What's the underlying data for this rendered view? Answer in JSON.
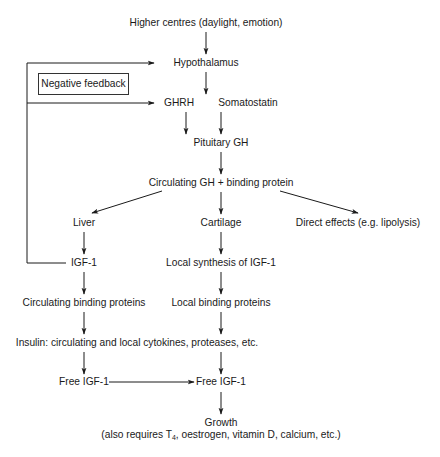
{
  "diagram": {
    "type": "flowchart",
    "topic": "Growth hormone / IGF-1 axis",
    "nodes": {
      "higher_centres": "Higher centres (daylight, emotion)",
      "hypothalamus": "Hypothalamus",
      "ghrh": "GHRH",
      "somatostatin": "Somatostatin",
      "pituitary_gh": "Pituitary GH",
      "circulating_gh": "Circulating GH + binding protein",
      "liver": "Liver",
      "cartilage": "Cartilage",
      "direct_effects": "Direct effects (e.g. lipolysis)",
      "igf1": "IGF-1",
      "local_synthesis": "Local synthesis of IGF-1",
      "circulating_bp": "Circulating binding proteins",
      "local_bp": "Local binding proteins",
      "insulin": "Insulin: circulating and local cytokines, proteases, etc.",
      "free_igf1_left": "Free IGF-1",
      "free_igf1_right": "Free IGF-1",
      "growth": "Growth",
      "growth_note_pre": "(also requires T",
      "growth_note_sub": "4",
      "growth_note_post": ", oestrogen, vitamin D, calcium, etc.)"
    },
    "feedback_label": "Negative feedback",
    "edges": [
      [
        "higher_centres",
        "hypothalamus"
      ],
      [
        "hypothalamus",
        "ghrh"
      ],
      [
        "ghrh",
        "pituitary_gh"
      ],
      [
        "somatostatin",
        "pituitary_gh"
      ],
      [
        "pituitary_gh",
        "circulating_gh"
      ],
      [
        "circulating_gh",
        "liver"
      ],
      [
        "circulating_gh",
        "cartilage"
      ],
      [
        "circulating_gh",
        "direct_effects"
      ],
      [
        "liver",
        "igf1"
      ],
      [
        "cartilage",
        "local_synthesis"
      ],
      [
        "igf1",
        "circulating_bp"
      ],
      [
        "local_synthesis",
        "local_bp"
      ],
      [
        "circulating_bp",
        "insulin"
      ],
      [
        "local_bp",
        "insulin"
      ],
      [
        "insulin",
        "free_igf1_left"
      ],
      [
        "insulin",
        "free_igf1_right"
      ],
      [
        "free_igf1_left",
        "free_igf1_right"
      ],
      [
        "free_igf1_right",
        "growth"
      ],
      [
        "igf1",
        "hypothalamus",
        "negative feedback"
      ],
      [
        "igf1",
        "ghrh",
        "negative feedback"
      ]
    ],
    "colors": {
      "line": "#1a1a1a",
      "text": "#1a1a1a",
      "background": "#ffffff"
    }
  }
}
